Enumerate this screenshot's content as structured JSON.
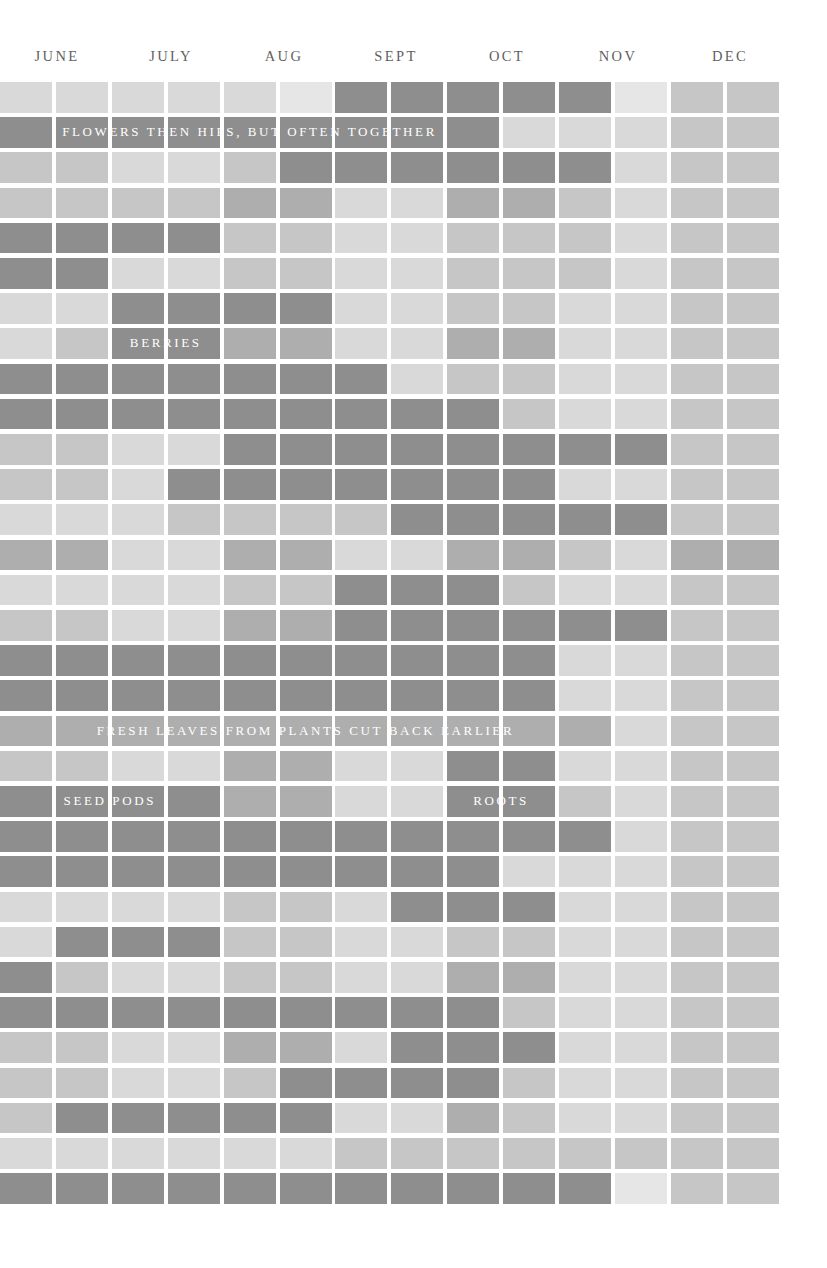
{
  "chart_data": {
    "type": "heatmap",
    "title": "",
    "xlabel": "",
    "ylabel": "",
    "grid": false,
    "legend_position": "none",
    "months": [
      "JUNE",
      "JULY",
      "AUG",
      "SEPT",
      "OCT",
      "NOV",
      "DEC"
    ],
    "columns": 14,
    "rows": 32,
    "tone_scale": {
      "g5": "#e6e6e6",
      "g1": "#d9d9d9",
      "g2": "#c6c6c6",
      "g3": "#aeaeae",
      "g4": "#8e8e8e"
    },
    "annotations": [
      {
        "text": "FLOWERS THEN HIPS, BUT OFTEN TOGETHER",
        "row": 1,
        "col_start": 0,
        "col_span": 9
      },
      {
        "text": "BERRIES",
        "row": 7,
        "col_start": 2,
        "col_span": 2
      },
      {
        "text": "FRESH LEAVES FROM PLANTS CUT BACK EARLIER",
        "row": 18,
        "col_start": 0,
        "col_span": 11
      },
      {
        "text": "SEED PODS",
        "row": 20,
        "col_start": 0,
        "col_span": 4
      },
      {
        "text": "ROOTS",
        "row": 20,
        "col_start": 8,
        "col_span": 2
      }
    ],
    "values": [
      [
        "g1",
        "g1",
        "g1",
        "g1",
        "g1",
        "g5",
        "g4",
        "g4",
        "g4",
        "g4",
        "g4",
        "g5",
        "g2",
        "g2"
      ],
      [
        "g4",
        "g4",
        "g4",
        "g4",
        "g4",
        "g4",
        "g4",
        "g4",
        "g4",
        "g1",
        "g1",
        "g1",
        "g2",
        "g2"
      ],
      [
        "g2",
        "g2",
        "g1",
        "g1",
        "g2",
        "g4",
        "g4",
        "g4",
        "g4",
        "g4",
        "g4",
        "g1",
        "g2",
        "g2"
      ],
      [
        "g2",
        "g2",
        "g2",
        "g2",
        "g3",
        "g3",
        "g1",
        "g1",
        "g3",
        "g3",
        "g2",
        "g1",
        "g2",
        "g2"
      ],
      [
        "g4",
        "g4",
        "g4",
        "g4",
        "g2",
        "g2",
        "g1",
        "g1",
        "g2",
        "g2",
        "g2",
        "g1",
        "g2",
        "g2"
      ],
      [
        "g4",
        "g4",
        "g1",
        "g1",
        "g2",
        "g2",
        "g1",
        "g1",
        "g2",
        "g2",
        "g2",
        "g1",
        "g2",
        "g2"
      ],
      [
        "g1",
        "g1",
        "g4",
        "g4",
        "g4",
        "g4",
        "g1",
        "g1",
        "g2",
        "g2",
        "g1",
        "g1",
        "g2",
        "g2"
      ],
      [
        "g1",
        "g2",
        "g4",
        "g4",
        "g3",
        "g3",
        "g1",
        "g1",
        "g3",
        "g3",
        "g1",
        "g1",
        "g2",
        "g2"
      ],
      [
        "g4",
        "g4",
        "g4",
        "g4",
        "g4",
        "g4",
        "g4",
        "g1",
        "g2",
        "g2",
        "g1",
        "g1",
        "g2",
        "g2"
      ],
      [
        "g4",
        "g4",
        "g4",
        "g4",
        "g4",
        "g4",
        "g4",
        "g4",
        "g4",
        "g2",
        "g1",
        "g1",
        "g2",
        "g2"
      ],
      [
        "g2",
        "g2",
        "g1",
        "g1",
        "g4",
        "g4",
        "g4",
        "g4",
        "g4",
        "g4",
        "g4",
        "g4",
        "g2",
        "g2"
      ],
      [
        "g2",
        "g2",
        "g1",
        "g4",
        "g4",
        "g4",
        "g4",
        "g4",
        "g4",
        "g4",
        "g1",
        "g1",
        "g2",
        "g2"
      ],
      [
        "g1",
        "g1",
        "g1",
        "g2",
        "g2",
        "g2",
        "g2",
        "g4",
        "g4",
        "g4",
        "g4",
        "g4",
        "g2",
        "g2"
      ],
      [
        "g3",
        "g3",
        "g1",
        "g1",
        "g3",
        "g3",
        "g1",
        "g1",
        "g3",
        "g3",
        "g2",
        "g1",
        "g3",
        "g3"
      ],
      [
        "g1",
        "g1",
        "g1",
        "g1",
        "g2",
        "g2",
        "g4",
        "g4",
        "g4",
        "g2",
        "g1",
        "g1",
        "g2",
        "g2"
      ],
      [
        "g2",
        "g2",
        "g1",
        "g1",
        "g3",
        "g3",
        "g4",
        "g4",
        "g4",
        "g4",
        "g4",
        "g4",
        "g2",
        "g2"
      ],
      [
        "g4",
        "g4",
        "g4",
        "g4",
        "g4",
        "g4",
        "g4",
        "g4",
        "g4",
        "g4",
        "g1",
        "g1",
        "g2",
        "g2"
      ],
      [
        "g4",
        "g4",
        "g4",
        "g4",
        "g4",
        "g4",
        "g4",
        "g4",
        "g4",
        "g4",
        "g1",
        "g1",
        "g2",
        "g2"
      ],
      [
        "g3",
        "g3",
        "g3",
        "g3",
        "g3",
        "g3",
        "g3",
        "g3",
        "g3",
        "g3",
        "g3",
        "g1",
        "g2",
        "g2"
      ],
      [
        "g2",
        "g2",
        "g1",
        "g1",
        "g3",
        "g3",
        "g1",
        "g1",
        "g4",
        "g4",
        "g1",
        "g1",
        "g2",
        "g2"
      ],
      [
        "g4",
        "g4",
        "g4",
        "g4",
        "g3",
        "g3",
        "g1",
        "g1",
        "g4",
        "g4",
        "g2",
        "g1",
        "g2",
        "g2"
      ],
      [
        "g4",
        "g4",
        "g4",
        "g4",
        "g4",
        "g4",
        "g4",
        "g4",
        "g4",
        "g4",
        "g4",
        "g1",
        "g2",
        "g2"
      ],
      [
        "g4",
        "g4",
        "g4",
        "g4",
        "g4",
        "g4",
        "g4",
        "g4",
        "g4",
        "g1",
        "g1",
        "g1",
        "g2",
        "g2"
      ],
      [
        "g1",
        "g1",
        "g1",
        "g1",
        "g2",
        "g2",
        "g1",
        "g4",
        "g4",
        "g4",
        "g1",
        "g1",
        "g2",
        "g2"
      ],
      [
        "g1",
        "g4",
        "g4",
        "g4",
        "g2",
        "g2",
        "g1",
        "g1",
        "g2",
        "g2",
        "g1",
        "g1",
        "g2",
        "g2"
      ],
      [
        "g4",
        "g2",
        "g1",
        "g1",
        "g2",
        "g2",
        "g1",
        "g1",
        "g3",
        "g3",
        "g1",
        "g1",
        "g2",
        "g2"
      ],
      [
        "g4",
        "g4",
        "g4",
        "g4",
        "g4",
        "g4",
        "g4",
        "g4",
        "g4",
        "g2",
        "g1",
        "g1",
        "g2",
        "g2"
      ],
      [
        "g2",
        "g2",
        "g1",
        "g1",
        "g3",
        "g3",
        "g1",
        "g4",
        "g4",
        "g4",
        "g1",
        "g1",
        "g2",
        "g2"
      ],
      [
        "g2",
        "g2",
        "g1",
        "g1",
        "g2",
        "g4",
        "g4",
        "g4",
        "g4",
        "g2",
        "g1",
        "g1",
        "g2",
        "g2"
      ],
      [
        "g2",
        "g4",
        "g4",
        "g4",
        "g4",
        "g4",
        "g1",
        "g1",
        "g3",
        "g2",
        "g1",
        "g1",
        "g2",
        "g2"
      ],
      [
        "g1",
        "g1",
        "g1",
        "g1",
        "g1",
        "g1",
        "g2",
        "g2",
        "g2",
        "g2",
        "g2",
        "g2",
        "g2",
        "g2"
      ],
      [
        "g4",
        "g4",
        "g4",
        "g4",
        "g4",
        "g4",
        "g4",
        "g4",
        "g4",
        "g4",
        "g4",
        "g5",
        "g2",
        "g2"
      ]
    ]
  },
  "header": {
    "months": [
      {
        "label": "JUNE",
        "left": 0,
        "width": 114
      },
      {
        "label": "JULY",
        "left": 114,
        "width": 114
      },
      {
        "label": "AUG",
        "left": 228,
        "width": 112
      },
      {
        "label": "SEPT",
        "left": 340,
        "width": 112
      },
      {
        "label": "OCT",
        "left": 452,
        "width": 110
      },
      {
        "label": "NOV",
        "left": 562,
        "width": 112
      },
      {
        "label": "DEC",
        "left": 674,
        "width": 112
      }
    ]
  }
}
